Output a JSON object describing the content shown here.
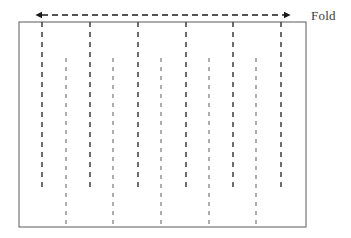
{
  "figure": {
    "type": "diagram",
    "title": "",
    "background_color": "#ffffff",
    "canvas": {
      "width": 351,
      "height": 238
    },
    "labels": {
      "fold": "Fold"
    },
    "label_positions": {
      "fold": {
        "x": 311,
        "y": 8
      }
    },
    "sheet": {
      "name": "paper-sheet-rectangle",
      "x": 19,
      "y": 22,
      "width": 287,
      "height": 205,
      "stroke_color": "#5a5a5a",
      "stroke_width": 1,
      "fill": "#ffffff"
    },
    "fold_arrow": {
      "name": "fold-width-arrow",
      "y": 15,
      "x_start": 42,
      "x_end": 284,
      "stroke_color": "#1a1a1a",
      "stroke_width": 1.3,
      "dash_pattern": "6,4",
      "arrowheads": "both",
      "arrowhead_size": 7
    },
    "crease_lines": {
      "stroke_color": "#4a4a4a",
      "mountain_color": "#3d3d3d",
      "valley_color": "#6a6a6a",
      "dash_pattern_long": "5,5",
      "dash_pattern_short": "4,5",
      "stroke_width_long": 1.5,
      "stroke_width_short": 1.1,
      "top_edge_y": 22,
      "bottom_edge_y": 227,
      "group_a_label": "lines-from-top-edge",
      "group_b_label": "lines-to-bottom-edge",
      "group_a": [
        {
          "x": 42,
          "y1": 22,
          "y2": 191
        },
        {
          "x": 90,
          "y1": 22,
          "y2": 191
        },
        {
          "x": 138,
          "y1": 22,
          "y2": 191
        },
        {
          "x": 186,
          "y1": 22,
          "y2": 191
        },
        {
          "x": 233,
          "y1": 22,
          "y2": 191
        },
        {
          "x": 281,
          "y1": 22,
          "y2": 191
        }
      ],
      "group_b": [
        {
          "x": 66,
          "y1": 58,
          "y2": 227
        },
        {
          "x": 113,
          "y1": 58,
          "y2": 227
        },
        {
          "x": 161,
          "y1": 58,
          "y2": 227
        },
        {
          "x": 209,
          "y1": 58,
          "y2": 227
        },
        {
          "x": 256,
          "y1": 58,
          "y2": 227
        }
      ]
    }
  }
}
